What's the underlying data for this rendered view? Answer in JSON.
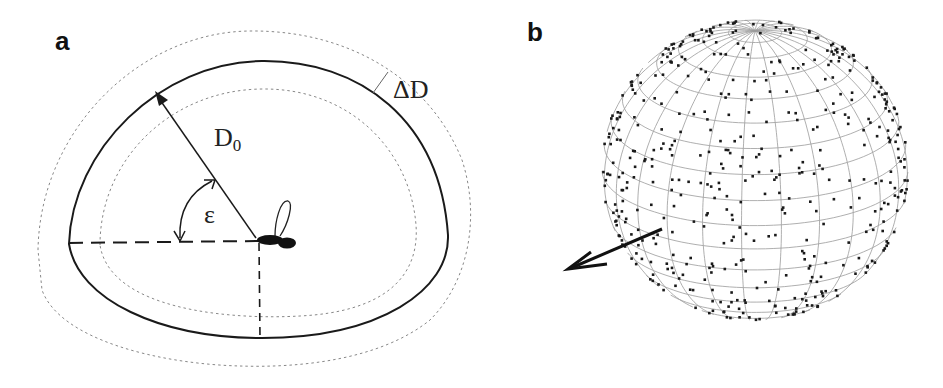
{
  "figure": {
    "panel_a": {
      "label": "a",
      "distance_label": "D",
      "distance_subscript": "0",
      "band_label": "ΔD",
      "angle_label": "ε",
      "description": "Fly at center; solid closed curve at distance D0 from fly along elevation angle epsilon; dotted curves at +/- delta D"
    },
    "panel_b": {
      "label": "b",
      "description": "Wireframe sphere with scattered points, arrow indicating heading direction"
    }
  },
  "colors": {
    "ink": "#1a1a1a",
    "grid": "#9a9a9a",
    "dotted": "#777777",
    "background": "#ffffff"
  }
}
